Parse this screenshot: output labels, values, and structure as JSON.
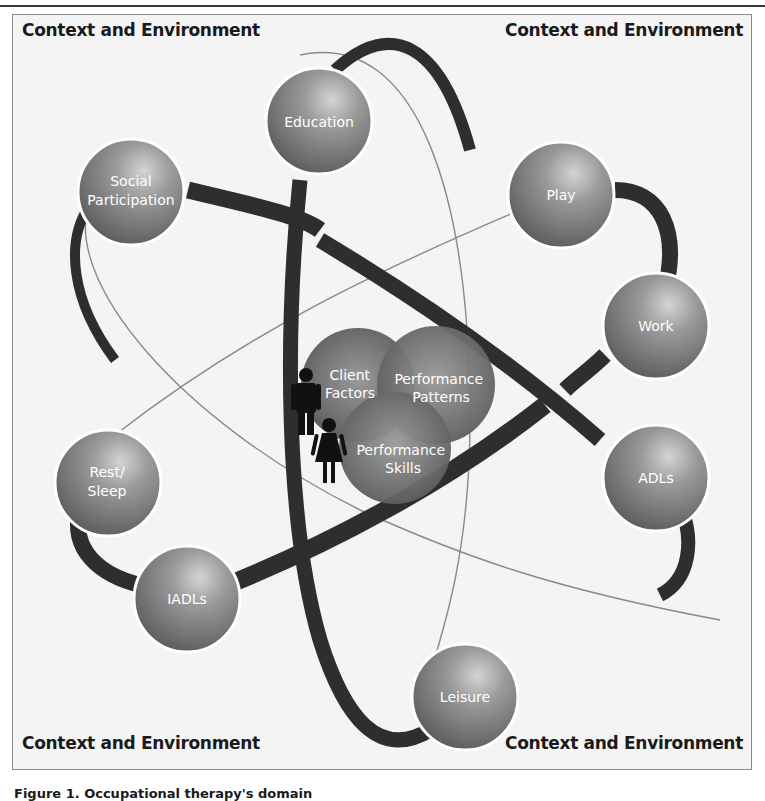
{
  "corner_labels": {
    "top_left": "Context and Environment",
    "top_right": "Context and Environment",
    "bottom_left": "Context and Environment",
    "bottom_right": "Context and Environment"
  },
  "occupations": [
    {
      "id": "education",
      "label": "Education"
    },
    {
      "id": "social-participation",
      "label_line1": "Social",
      "label_line2": "Participation"
    },
    {
      "id": "play",
      "label": "Play"
    },
    {
      "id": "work",
      "label": "Work"
    },
    {
      "id": "adls",
      "label": "ADLs"
    },
    {
      "id": "rest-sleep",
      "label_line1": "Rest/",
      "label_line2": "Sleep"
    },
    {
      "id": "iadls",
      "label": "IADLs"
    },
    {
      "id": "leisure",
      "label": "Leisure"
    }
  ],
  "core": {
    "client_factors": {
      "line1": "Client",
      "line2": "Factors"
    },
    "performance_patterns": {
      "line1": "Performance",
      "line2": "Patterns"
    },
    "performance_skills": {
      "line1": "Performance",
      "line2": "Skills"
    }
  },
  "figures": [
    "man-icon",
    "woman-icon"
  ],
  "caption": "Figure 1. Occupational therapy's domain",
  "colors": {
    "sphere": "#7a7a7a",
    "sphere_highlight": "#c8c8c8",
    "orbit_dark": "#2e2e2e",
    "orbit_thin": "#8a8a8a",
    "background": "#f4f4f4",
    "text": "#1a1a1a"
  }
}
